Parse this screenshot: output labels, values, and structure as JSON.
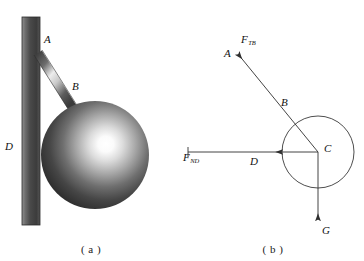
{
  "figure": {
    "width": 364,
    "height": 261,
    "background": "#ffffff",
    "stroke_color": "#3a3a3a",
    "label_color": "#111111"
  },
  "panel_a": {
    "caption": "( a )",
    "description": "Shaded sphere hanging from a rod attached to a vertical wall",
    "wall": {
      "label": "D",
      "x": 22,
      "y": 17,
      "width": 18,
      "height": 208,
      "color_dark": "#4a4a4a",
      "color_light": "#8c8c8c"
    },
    "rod": {
      "label_top": "A",
      "label_bottom": "B",
      "from_x": 38,
      "from_y": 52,
      "to_x": 72,
      "to_y": 108,
      "color_dark": "#3d3d3d",
      "color_light": "#e8e8e8"
    },
    "sphere": {
      "center_x": 95,
      "center_y": 155,
      "radius": 54,
      "highlight_x": 116,
      "highlight_y": 133,
      "color_center": "#ffffff",
      "color_edge": "#2b2b2b"
    },
    "labels": [
      {
        "text": "A",
        "x": 44,
        "y": 41
      },
      {
        "text": "B",
        "x": 72,
        "y": 88
      },
      {
        "text": "D",
        "x": 6,
        "y": 148
      }
    ]
  },
  "panel_b": {
    "caption": "( b )",
    "description": "Free-body diagram of the sphere showing tension, wall normal force and weight",
    "circle": {
      "center_x": 318,
      "center_y": 152,
      "radius": 36,
      "stroke": "#3a3a3a"
    },
    "center_point_label": "C",
    "forces": [
      {
        "name": "tension",
        "symbol": "F",
        "subscript": "TB",
        "from_x": 318,
        "from_y": 152,
        "to_x": 236,
        "to_y": 52,
        "direction": "up-left",
        "label_x": 242,
        "label_y": 41,
        "point_label": "A",
        "point_label_x": 226,
        "point_label_y": 55
      },
      {
        "name": "wall-normal-force",
        "symbol": "F",
        "subscript": "ND",
        "from_x": 188,
        "from_y": 152,
        "to_x": 318,
        "to_y": 152,
        "direction": "right",
        "label_x": 185,
        "label_y": 161,
        "midpoint_label": "D",
        "midpoint_label_x": 251,
        "midpoint_label_y": 163
      },
      {
        "name": "weight",
        "symbol": "G",
        "subscript": "",
        "from_x": 318,
        "from_y": 152,
        "to_x": 318,
        "to_y": 218,
        "direction": "down",
        "label_x": 322,
        "label_y": 232
      }
    ],
    "labels": [
      {
        "text": "A",
        "x": 226,
        "y": 55
      },
      {
        "text": "B",
        "x": 283,
        "y": 104
      },
      {
        "text": "C",
        "x": 325,
        "y": 150
      },
      {
        "text": "D",
        "x": 251,
        "y": 163
      },
      {
        "text": "G",
        "x": 322,
        "y": 232
      }
    ]
  }
}
